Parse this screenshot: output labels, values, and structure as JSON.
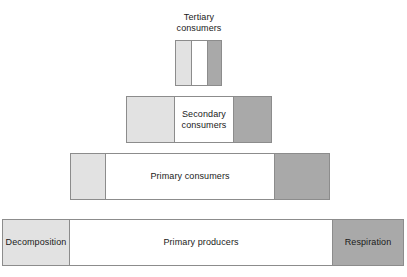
{
  "diagram": {
    "type": "trophic-pyramid",
    "colors": {
      "decomposition_fill": "#e2e2e2",
      "assimilation_fill": "#ffffff",
      "respiration_fill": "#a9a9a9",
      "outline": "#8c8c8c",
      "text": "#1a1a1a",
      "background": "#ffffff"
    },
    "levels": [
      {
        "id": "tertiary",
        "label": "Tertiary\nconsumers",
        "label_position": "above",
        "segments": [
          {
            "name": "decomposition",
            "fill": "light",
            "label": ""
          },
          {
            "name": "assimilation",
            "fill": "white",
            "label": ""
          },
          {
            "name": "respiration",
            "fill": "dark",
            "label": ""
          }
        ]
      },
      {
        "id": "secondary",
        "label": "Secondary\nconsumers",
        "label_position": "inside",
        "segments": [
          {
            "name": "decomposition",
            "fill": "light",
            "label": ""
          },
          {
            "name": "assimilation",
            "fill": "white",
            "label": "Secondary\nconsumers"
          },
          {
            "name": "respiration",
            "fill": "dark",
            "label": ""
          }
        ]
      },
      {
        "id": "primary-consumers",
        "label": "Primary consumers",
        "label_position": "inside",
        "segments": [
          {
            "name": "decomposition",
            "fill": "light",
            "label": ""
          },
          {
            "name": "assimilation",
            "fill": "white",
            "label": "Primary consumers"
          },
          {
            "name": "respiration",
            "fill": "dark",
            "label": ""
          }
        ]
      },
      {
        "id": "primary-producers",
        "label": "Primary producers",
        "label_position": "inside",
        "segments": [
          {
            "name": "decomposition",
            "fill": "light",
            "label": "Decomposition"
          },
          {
            "name": "assimilation",
            "fill": "white",
            "label": "Primary producers"
          },
          {
            "name": "respiration",
            "fill": "dark",
            "label": "Respiration"
          }
        ]
      }
    ]
  },
  "chart_data": {
    "type": "bar",
    "orientation": "horizontal",
    "categories": [
      "Tertiary consumers",
      "Secondary consumers",
      "Primary consumers",
      "Primary producers"
    ],
    "series": [
      {
        "name": "Decomposition",
        "values": [
          15,
          47,
          34,
          66
        ]
      },
      {
        "name": "Assimilation",
        "values": [
          16,
          59,
          169,
          263
        ]
      },
      {
        "name": "Respiration",
        "values": [
          14,
          38,
          55,
          71
        ]
      }
    ],
    "totals": [
      47,
      146,
      260,
      402
    ],
    "xlabel": "",
    "ylabel": "",
    "grid": false,
    "legend": "none"
  }
}
